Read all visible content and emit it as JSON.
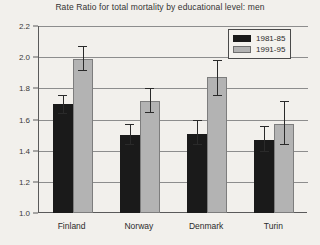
{
  "chart_data": {
    "type": "bar",
    "title": "Rate Ratio for total mortality by educational level: men",
    "xlabel": "",
    "ylabel": "Rate Ratio",
    "categories": [
      "Finland",
      "Norway",
      "Denmark",
      "Turin"
    ],
    "ylim": [
      1.0,
      2.2
    ],
    "yticks": [
      "1.0",
      "1.2",
      "1.4",
      "1.6",
      "1.8",
      "2.0",
      "2.2"
    ],
    "ytick_values": [
      1.0,
      1.2,
      1.4,
      1.6,
      1.8,
      2.0,
      2.2
    ],
    "grid": true,
    "legend_position": "top-right",
    "series": [
      {
        "name": "1981-85",
        "color": "#1a1a1a",
        "values": [
          1.7,
          1.5,
          1.51,
          1.47
        ],
        "err_low": [
          1.64,
          1.44,
          1.44,
          1.4
        ],
        "err_high": [
          1.76,
          1.57,
          1.6,
          1.56
        ]
      },
      {
        "name": "1991-95",
        "color": "#b3b3b3",
        "values": [
          1.99,
          1.72,
          1.87,
          1.57
        ],
        "err_low": [
          1.92,
          1.65,
          1.76,
          1.44
        ],
        "err_high": [
          2.07,
          1.8,
          1.98,
          1.72
        ]
      }
    ]
  }
}
